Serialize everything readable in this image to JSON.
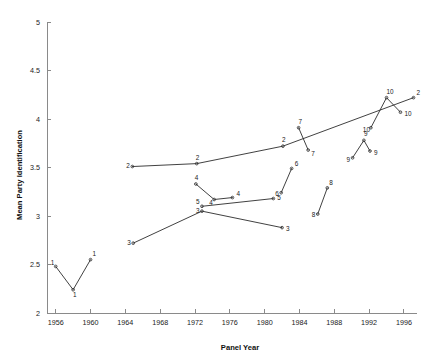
{
  "chart_data": {
    "type": "line",
    "title": "",
    "xlabel": "Panel Year",
    "ylabel": "Mean Party Identification",
    "xlim": [
      1955,
      1997.5
    ],
    "ylim": [
      2,
      5
    ],
    "xticks": [
      1956,
      1960,
      1964,
      1968,
      1972,
      1976,
      1980,
      1984,
      1988,
      1992,
      1996
    ],
    "xtick_labels": [
      "1956",
      "1960",
      "1964",
      "1968",
      "1972",
      "1976",
      "1980",
      "1984",
      "1988",
      "1992",
      "1996"
    ],
    "yticks": [
      2,
      2.5,
      3,
      3.5,
      4,
      4.5,
      5
    ],
    "ytick_labels": [
      "2",
      "2.5",
      "3",
      "3.5",
      "4",
      "4.5",
      "5"
    ],
    "grid": false,
    "legend": "none",
    "series": [
      {
        "name": "Panel 1",
        "label": "1",
        "x": [
          1956,
          1958,
          1960
        ],
        "values": [
          2.48,
          2.24,
          2.55
        ],
        "point_labels": [
          "1",
          "1",
          "1"
        ]
      },
      {
        "name": "Panel 2",
        "label": "2",
        "x": [
          1964.8,
          1972.2,
          1982.1,
          1997.1
        ],
        "values": [
          3.51,
          3.54,
          3.72,
          4.22
        ],
        "point_labels": [
          "2",
          "2",
          "2",
          "2"
        ]
      },
      {
        "name": "Panel 3",
        "label": "3",
        "x": [
          1964.9,
          1972.8,
          1982.0
        ],
        "values": [
          2.72,
          3.05,
          2.88
        ],
        "point_labels": [
          "3",
          "3",
          "3"
        ]
      },
      {
        "name": "Panel 4",
        "label": "4",
        "x": [
          1972.1,
          1974.2,
          1976.3
        ],
        "values": [
          3.33,
          3.17,
          3.19
        ],
        "point_labels": [
          "4",
          "4",
          "4"
        ]
      },
      {
        "name": "Panel 5",
        "label": "5",
        "x": [
          1972.8,
          1981.0
        ],
        "values": [
          3.1,
          3.18
        ],
        "point_labels": [
          "5",
          "5"
        ]
      },
      {
        "name": "Panel 6",
        "label": "6",
        "x": [
          1981.9,
          1983.1
        ],
        "values": [
          3.24,
          3.49
        ],
        "point_labels": [
          "6",
          "6"
        ]
      },
      {
        "name": "Panel 7",
        "label": "7",
        "x": [
          1983.9,
          1985.0
        ],
        "values": [
          3.91,
          3.68
        ],
        "point_labels": [
          "7",
          "7"
        ]
      },
      {
        "name": "Panel 8",
        "label": "8",
        "x": [
          1986.1,
          1987.2
        ],
        "values": [
          3.02,
          3.29
        ],
        "point_labels": [
          "8",
          "8"
        ]
      },
      {
        "name": "Panel 9",
        "label": "9",
        "x": [
          1990.1,
          1991.4,
          1992.1
        ],
        "values": [
          3.6,
          3.78,
          3.67
        ],
        "point_labels": [
          "9",
          "9",
          "9"
        ]
      },
      {
        "name": "Panel 10",
        "label": "10",
        "x": [
          1992.2,
          1994.0,
          1995.6
        ],
        "values": [
          3.91,
          4.22,
          4.07
        ],
        "point_labels": [
          "10",
          "10",
          "10"
        ]
      }
    ],
    "annotations": []
  },
  "colors": {
    "background": "#ffffff",
    "axis": "#8a8a8a",
    "line": "#2b2b2b",
    "text": "#1a1a1a"
  }
}
